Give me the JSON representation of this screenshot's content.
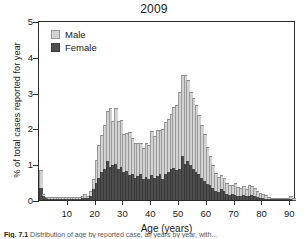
{
  "chart_data": {
    "type": "bar",
    "title": "2009",
    "xlabel": "Age (years)",
    "ylabel": "% of total cases reported for year",
    "xlim": [
      0,
      92
    ],
    "ylim": [
      0,
      5
    ],
    "xticks": [
      10,
      20,
      30,
      40,
      50,
      60,
      70,
      80,
      90
    ],
    "yticks": [
      0,
      1,
      2,
      3,
      4,
      5
    ],
    "grid": false,
    "stacked": true,
    "legend_position": "top-left",
    "legend": [
      "Male",
      "Female"
    ],
    "colors": {
      "male": "#d2d2d2",
      "female": "#4d4d4d",
      "axis": "#2a2a2a"
    },
    "x": [
      0,
      1,
      2,
      3,
      4,
      5,
      6,
      7,
      8,
      9,
      10,
      11,
      12,
      13,
      14,
      15,
      16,
      17,
      18,
      19,
      20,
      21,
      22,
      23,
      24,
      25,
      26,
      27,
      28,
      29,
      30,
      31,
      32,
      33,
      34,
      35,
      36,
      37,
      38,
      39,
      40,
      41,
      42,
      43,
      44,
      45,
      46,
      47,
      48,
      49,
      50,
      51,
      52,
      53,
      54,
      55,
      56,
      57,
      58,
      59,
      60,
      61,
      62,
      63,
      64,
      65,
      66,
      67,
      68,
      69,
      70,
      71,
      72,
      73,
      74,
      75,
      76,
      77,
      78,
      79,
      80,
      81,
      82,
      83,
      84,
      85,
      86,
      87,
      88,
      89,
      90,
      91
    ],
    "series": [
      {
        "name": "Female",
        "values": [
          0.34,
          0.1,
          0.05,
          0.04,
          0.03,
          0.03,
          0.03,
          0.03,
          0.03,
          0.03,
          0.03,
          0.03,
          0.03,
          0.04,
          0.04,
          0.05,
          0.05,
          0.06,
          0.12,
          0.3,
          0.48,
          0.62,
          0.78,
          0.86,
          1.08,
          0.92,
          0.98,
          1.02,
          0.86,
          0.92,
          0.78,
          0.82,
          0.7,
          0.74,
          0.62,
          0.66,
          0.72,
          0.6,
          0.64,
          0.58,
          0.7,
          0.62,
          0.66,
          0.72,
          0.6,
          0.72,
          0.78,
          0.86,
          0.9,
          0.84,
          0.86,
          1.22,
          1.02,
          1.1,
          0.98,
          0.86,
          0.78,
          0.74,
          0.62,
          0.54,
          0.46,
          0.42,
          0.34,
          0.26,
          0.22,
          0.3,
          0.26,
          0.18,
          0.14,
          0.16,
          0.14,
          0.12,
          0.12,
          0.14,
          0.1,
          0.12,
          0.14,
          0.12,
          0.08,
          0.06,
          0.05,
          0.04,
          0.02,
          0.02,
          0.02,
          0.02,
          0.02,
          0.02,
          0.02,
          0.02,
          0.04,
          0.01
        ]
      },
      {
        "name": "Male",
        "values": [
          0.48,
          0.04,
          0.02,
          0.02,
          0.02,
          0.03,
          0.02,
          0.02,
          0.02,
          0.02,
          0.03,
          0.02,
          0.02,
          0.02,
          0.03,
          0.03,
          0.08,
          0.03,
          0.1,
          0.26,
          0.6,
          0.88,
          1.02,
          1.22,
          1.38,
          1.62,
          1.2,
          1.52,
          1.32,
          1.28,
          1.04,
          1.04,
          1.18,
          0.96,
          0.96,
          0.9,
          0.86,
          0.84,
          0.92,
          0.94,
          1.2,
          1.14,
          1.28,
          1.2,
          1.36,
          1.44,
          1.46,
          1.52,
          1.68,
          1.8,
          2.12,
          2.24,
          2.46,
          2.22,
          2.02,
          1.96,
          1.86,
          1.62,
          1.46,
          1.28,
          1.0,
          0.78,
          0.62,
          0.46,
          0.4,
          0.36,
          0.34,
          0.28,
          0.26,
          0.22,
          0.3,
          0.22,
          0.2,
          0.22,
          0.18,
          0.26,
          0.22,
          0.2,
          0.14,
          0.1,
          0.08,
          0.06,
          0.03,
          0.02,
          0.02,
          0.02,
          0.02,
          0.02,
          0.02,
          0.02,
          0.04,
          0.01
        ]
      }
    ],
    "totals_note": "Bars are stacked: Female (dark) at base, Male (light) above."
  },
  "caption": {
    "prefix": "Fig. 7.1",
    "text": "Distribution of age by reported case, all years by year, with..."
  }
}
